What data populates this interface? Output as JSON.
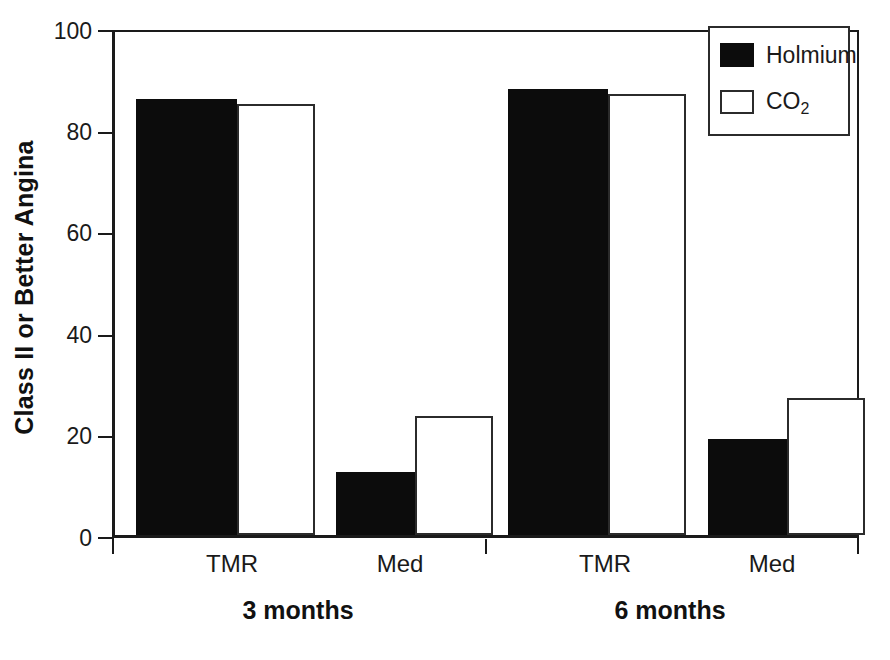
{
  "chart_data": {
    "type": "bar",
    "title": "",
    "xlabel": "",
    "ylabel": "Class II or Better Angina",
    "ylim": [
      0,
      100
    ],
    "yticks": [
      0,
      20,
      40,
      60,
      80,
      100
    ],
    "grid": false,
    "legend_position": "top-right",
    "categories": [
      "TMR",
      "Med",
      "TMR",
      "Med"
    ],
    "groups": [
      {
        "label": "3 months",
        "categories": [
          "TMR",
          "Med"
        ]
      },
      {
        "label": "6 months",
        "categories": [
          "TMR",
          "Med"
        ]
      }
    ],
    "series": [
      {
        "name": "Holmium",
        "style": "filled",
        "color": "#0c0c0c",
        "values": [
          86,
          12.5,
          88,
          19
        ]
      },
      {
        "name": "CO2",
        "style": "open",
        "color": "#ffffff",
        "values": [
          85,
          23.5,
          87,
          27
        ]
      }
    ],
    "bars": [
      {
        "group": "3 months",
        "category": "TMR",
        "series": "Holmium",
        "value": 86
      },
      {
        "group": "3 months",
        "category": "TMR",
        "series": "CO2",
        "value": 85
      },
      {
        "group": "3 months",
        "category": "Med",
        "series": "Holmium",
        "value": 12.5
      },
      {
        "group": "3 months",
        "category": "Med",
        "series": "CO2",
        "value": 23.5
      },
      {
        "group": "6 months",
        "category": "TMR",
        "series": "Holmium",
        "value": 88
      },
      {
        "group": "6 months",
        "category": "TMR",
        "series": "CO2",
        "value": 87
      },
      {
        "group": "6 months",
        "category": "Med",
        "series": "Holmium",
        "value": 19
      },
      {
        "group": "6 months",
        "category": "Med",
        "series": "CO2",
        "value": 27
      }
    ]
  },
  "axis": {
    "y_title": "Class II or Better Angina",
    "y_tick_labels": [
      "100",
      "80",
      "60",
      "40",
      "20",
      "0"
    ]
  },
  "x_labels": {
    "g1_tmr": "TMR",
    "g1_med": "Med",
    "g2_tmr": "TMR",
    "g2_med": "Med"
  },
  "group_labels": {
    "g1": "3 months",
    "g2": "6 months"
  },
  "legend": {
    "items": [
      {
        "label": "Holmium",
        "style": "filled"
      },
      {
        "label": "CO",
        "sub": "2",
        "style": "open"
      }
    ],
    "item0_label": "Holmium",
    "item1_label": "CO",
    "item1_sub": "2"
  }
}
